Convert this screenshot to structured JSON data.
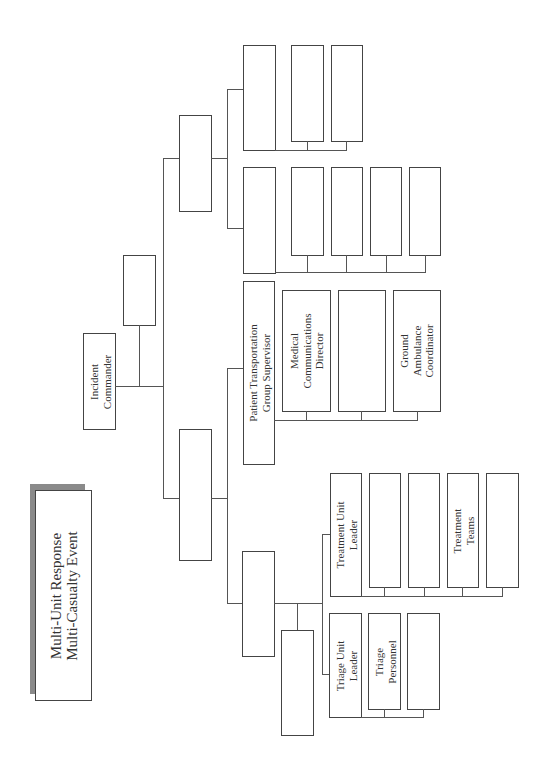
{
  "title": {
    "line1": "Multi-Unit Response",
    "line2": "Multi-Casualty Event"
  },
  "orientation": "rotated 90° counter-clockwise",
  "command": {
    "incident_commander": {
      "line1": "Incident",
      "line2": "Commander"
    },
    "command_staff": ""
  },
  "sections": {
    "upper_section": "",
    "upper_row1": {
      "leader": "",
      "members": [
        "",
        ""
      ]
    },
    "upper_row2": {
      "leader": "",
      "members": [
        "",
        "",
        "",
        ""
      ]
    },
    "lower_section": "",
    "patient_transportation": {
      "leader": {
        "line1": "Patient Transportation",
        "line2": "Group Supervisor"
      },
      "members": [
        {
          "line1": "Medical",
          "line2": "Communications",
          "line3": "Director"
        },
        {
          "line1": "",
          "line2": "",
          "line3": ""
        },
        {
          "line1": "Ground",
          "line2": "Ambulance",
          "line3": "Coordinator"
        }
      ]
    },
    "medical_group": {
      "supervisor": "",
      "staff": "",
      "treatment": {
        "leader": {
          "line1": "Treatment Unit",
          "line2": "Leader"
        },
        "members": [
          {
            "line1": "",
            "line2": ""
          },
          {
            "line1": "",
            "line2": ""
          },
          {
            "line1": "Treatment",
            "line2": "Teams"
          },
          {
            "line1": "",
            "line2": ""
          }
        ]
      },
      "triage": {
        "leader": {
          "line1": "Triage Unit",
          "line2": "Leader"
        },
        "members": [
          {
            "line1": "Triage",
            "line2": "Personnel"
          },
          {
            "line1": "",
            "line2": ""
          }
        ]
      }
    }
  }
}
